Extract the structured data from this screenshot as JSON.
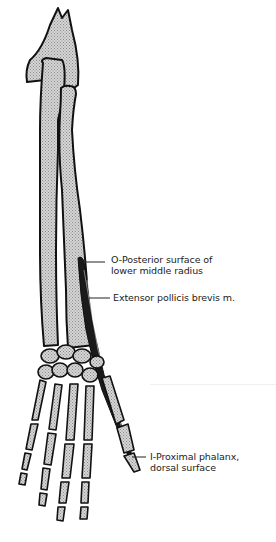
{
  "figure": {
    "colors": {
      "bone_fill": "#c8c8c8",
      "bone_outline": "#111111",
      "muscle": "#1a1a1a",
      "text": "#222222",
      "background": "#ffffff"
    },
    "labels": {
      "origin_line1": "O-Posterior surface of",
      "origin_line2": "lower middle radius",
      "muscle": "Extensor pollicis brevis m.",
      "insertion_line1": "I-Proximal phalanx,",
      "insertion_line2": "dorsal surface"
    }
  }
}
